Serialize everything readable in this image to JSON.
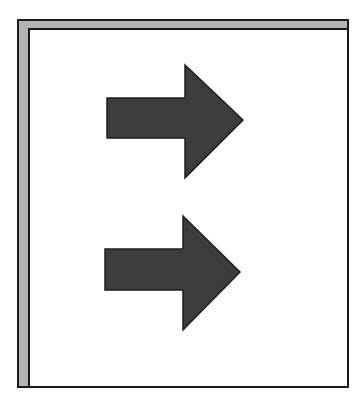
{
  "figure": {
    "colors": {
      "frame_border": "#1a1a1a",
      "frame_band": "#b4b4b4",
      "panel_background": "#ffffff",
      "arrow_fill": "#3c3c3c",
      "arrow_stroke": "#1e1e1e"
    },
    "arrows": [
      {
        "name": "top-arrow",
        "direction": "right",
        "points": "107,98 185,98 185,65 243,120 185,178 185,138 107,138"
      },
      {
        "name": "bottom-arrow",
        "direction": "right",
        "points": "105,249 183,249 183,216 240,272 183,330 183,290 105,290"
      }
    ]
  }
}
